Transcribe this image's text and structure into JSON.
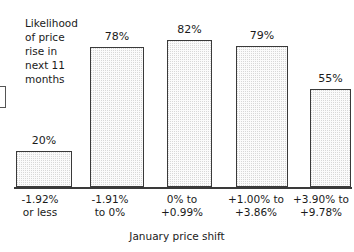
{
  "chart_data": {
    "type": "bar",
    "title": "",
    "subtitle": "",
    "xlabel": "January price shift",
    "ylabel": "Likelihood of price rise in next 11 months",
    "ylabel_lines": "Likelihood\nof price\nrise in\nnext 11\nmonths",
    "categories": [
      "-1.92%\nor less",
      "-1.91%\nto 0%",
      "0% to\n+0.99%",
      "+1.00% to\n+3.86%",
      "+3.90% to\n+9.78%"
    ],
    "values": [
      20,
      78,
      82,
      79,
      55
    ],
    "value_labels": [
      "20%",
      "78%",
      "82%",
      "79%",
      "55%"
    ],
    "ylim": [
      0,
      100
    ],
    "grid": false,
    "legend": "none",
    "units": "percent",
    "bar_fill": "#fbfbfb",
    "bar_stipple": "#d8d8d8",
    "bar_border": "#3a3a3a",
    "axis_color": "#3a3a3a",
    "text_color": "#1a1a1a",
    "background": "#ffffff"
  }
}
